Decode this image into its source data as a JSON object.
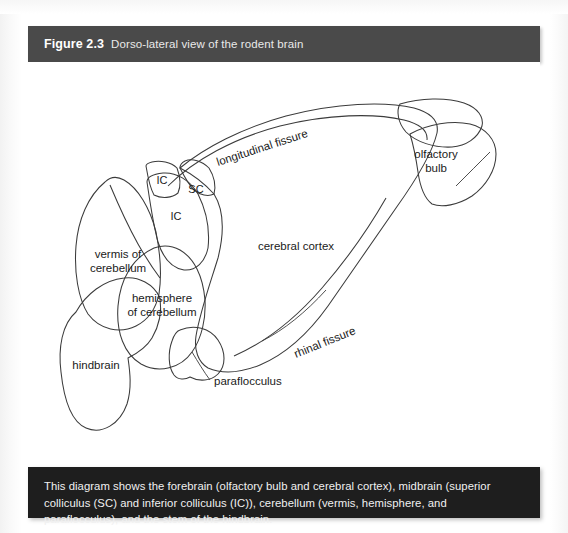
{
  "figure": {
    "number": "Figure 2.3",
    "title": "Dorso-lateral view of the rodent brain",
    "caption": "This diagram shows the forebrain (olfactory bulb and cerebral cortex), midbrain (superior colliculus (SC) and inferior colliculus (IC)), cerebellum (vermis, hemisphere, and paraflocculus), and the stem of the hindbrain.",
    "colors": {
      "header_background": "#4a4a4a",
      "caption_background": "#1e1e1e",
      "header_text": "#ffffff",
      "caption_text": "#f0f0f0",
      "outline": "#3b3b3b",
      "cortex_fill": "#ffffff",
      "cerebellum_fill": "#eeeeee",
      "hindbrain_fill": "#d8d8d8"
    }
  },
  "diagram": {
    "type": "anatomical-illustration",
    "labels": {
      "longitudinal_fissure": "longitudinal fissure",
      "olfactory_bulb_line1": "olfactory",
      "olfactory_bulb_line2": "bulb",
      "cerebral_cortex": "cerebral cortex",
      "rhinal_fissure": "rhinal fissure",
      "inferior_colliculus_upper": "IC",
      "inferior_colliculus_lower": "IC",
      "superior_colliculus": "SC",
      "vermis_line1": "vermis of",
      "vermis_line2": "cerebellum",
      "hemisphere_line1": "hemisphere",
      "hemisphere_line2": "of cerebellum",
      "hindbrain": "hindbrain",
      "paraflocculus": "paraflocculus"
    }
  }
}
